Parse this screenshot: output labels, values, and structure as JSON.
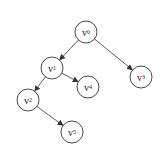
{
  "diagram": {
    "type": "tree",
    "colors": {
      "stroke": "#333333",
      "background": "#ffffff",
      "text": "#222222"
    },
    "nodes": [
      {
        "id": "v0",
        "base": "v",
        "sub": "0",
        "x": 86,
        "y": 32
      },
      {
        "id": "v1",
        "base": "v",
        "sub": "1",
        "x": 52,
        "y": 68
      },
      {
        "id": "v3",
        "base": "v",
        "sub": "3",
        "x": 141,
        "y": 77
      },
      {
        "id": "v4",
        "base": "v",
        "sub": "4",
        "x": 88,
        "y": 87
      },
      {
        "id": "v2",
        "base": "v",
        "sub": "2",
        "x": 28,
        "y": 100
      },
      {
        "id": "v5",
        "base": "v",
        "sub": "5",
        "x": 72,
        "y": 132
      }
    ],
    "edges": [
      {
        "from": "v0",
        "to": "v1"
      },
      {
        "from": "v0",
        "to": "v3"
      },
      {
        "from": "v1",
        "to": "v2"
      },
      {
        "from": "v1",
        "to": "v4"
      },
      {
        "from": "v2",
        "to": "v5"
      }
    ]
  }
}
